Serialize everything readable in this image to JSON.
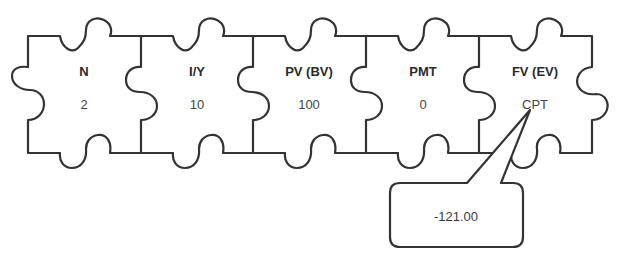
{
  "diagram": {
    "type": "jigsaw-puzzle-calculator-inputs",
    "pieces": [
      {
        "title": "N",
        "value": "2"
      },
      {
        "title": "I/Y",
        "value": "10"
      },
      {
        "title": "PV (BV)",
        "value": "100"
      },
      {
        "title": "PMT",
        "value": "0"
      },
      {
        "title": "FV (EV)",
        "value": "CPT"
      }
    ],
    "callout": {
      "target_piece": "FV (EV)",
      "text": "-121.00"
    },
    "colors": {
      "stroke": "#333333",
      "fill": "#ffffff",
      "text": "#2a2a2a"
    }
  }
}
